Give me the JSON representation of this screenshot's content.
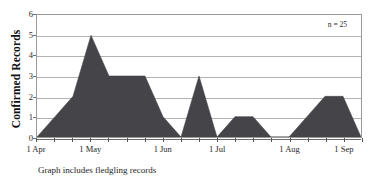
{
  "figure": {
    "title": "",
    "caption": "Graph includes fledgling records",
    "annotation": "n = 25"
  },
  "chart_data": {
    "type": "area",
    "title": "",
    "subtitle": "",
    "xlabel": "",
    "ylabel": "Confirmed Records",
    "ylim": [
      0,
      6
    ],
    "yticks": [
      0,
      1,
      2,
      3,
      4,
      5,
      6
    ],
    "ytick_labels": [
      "0",
      "1",
      "2",
      "3",
      "4",
      "5",
      "6"
    ],
    "xlim": [
      0,
      18
    ],
    "xtick_labels": [
      "1 Apr",
      "1 May",
      "1 Jun",
      "1 Jul",
      "1 Aug",
      "1 Sep"
    ],
    "xtick_positions": [
      0,
      3,
      7,
      10,
      14,
      17
    ],
    "minor_xticks": [
      0,
      1,
      2,
      3,
      4,
      5,
      6,
      7,
      8,
      9,
      10,
      11,
      12,
      13,
      14,
      15,
      16,
      17,
      18
    ],
    "grid": "horizontal",
    "legend": "none",
    "annotations": [
      {
        "text": "n = 25",
        "x": 16.2,
        "y": 5.6
      }
    ],
    "series": [
      {
        "name": "Confirmed Records",
        "fill_color": "#454549",
        "x": [
          0,
          1,
          2,
          3,
          4,
          5,
          6,
          7,
          8,
          9,
          10,
          11,
          12,
          13,
          14,
          15,
          16,
          17,
          18
        ],
        "values": [
          0,
          1,
          2,
          5,
          3,
          3,
          3,
          1,
          0,
          3,
          0,
          1,
          1,
          0,
          0,
          1,
          2,
          2,
          0
        ]
      }
    ],
    "x_point_labels": [
      "1 Apr",
      "8 Apr",
      "15 Apr",
      "1 May",
      "8 May",
      "15 May",
      "22 May",
      "1 Jun",
      "8 Jun",
      "15 Jun",
      "1 Jul",
      "8 Jul",
      "15 Jul",
      "22 Jul",
      "1 Aug",
      "8 Aug",
      "15 Aug",
      "1 Sep",
      "8 Sep"
    ],
    "total_records": 25
  },
  "colors": {
    "fill": "#454549",
    "gridline": "#b3b3b3",
    "frame": "#9a9a9a",
    "text": "#1a1a1a",
    "background": "#ffffff"
  }
}
